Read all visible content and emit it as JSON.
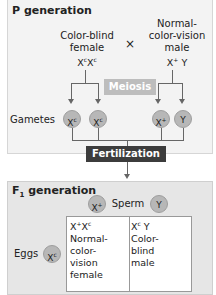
{
  "p_generation": {
    "title": "P generation",
    "female": {
      "label_line1": "Color-blind",
      "label_line2": "female",
      "genotype_a": "X",
      "sup_a": "c",
      "genotype_b": "X",
      "sup_b": "c"
    },
    "cross_symbol": "×",
    "male": {
      "label_line1": "Normal-",
      "label_line2": "color-vision",
      "label_line3": "male",
      "genotype_a": "X",
      "sup_a": "+",
      "genotype_b": "Y"
    },
    "meiosis_label": "Meiosis",
    "gametes_label": "Gametes",
    "gametes": [
      {
        "base": "X",
        "sup": "c"
      },
      {
        "base": "X",
        "sup": "c"
      },
      {
        "base": "X",
        "sup": "+"
      },
      {
        "base": "Y",
        "sup": ""
      }
    ],
    "fertilization_label": "Fertilization"
  },
  "f1_generation": {
    "title_main": "F",
    "title_sub": "1",
    "title_rest": " generation",
    "sperm_label": "Sperm",
    "sperm": [
      {
        "base": "X",
        "sup": "+"
      },
      {
        "base": "Y",
        "sup": ""
      }
    ],
    "eggs_label": "Eggs",
    "egg": {
      "base": "X",
      "sup": "c"
    },
    "cells": [
      {
        "g1": "X",
        "s1": "+",
        "g2": "X",
        "s2": "c",
        "lines": [
          "Normal-",
          "color-",
          "vision",
          "female"
        ]
      },
      {
        "g1": "X",
        "s1": "c",
        "g2": " Y",
        "s2": "",
        "lines": [
          "Color-",
          "blind",
          "male"
        ]
      }
    ]
  },
  "colors": {
    "panel_p": "#f3f3f3",
    "panel_f1": "#e6e6e6",
    "circle": "#b7b7b7",
    "meiosis": "#bdbdbd",
    "fertilization": "#3c3c3c"
  }
}
